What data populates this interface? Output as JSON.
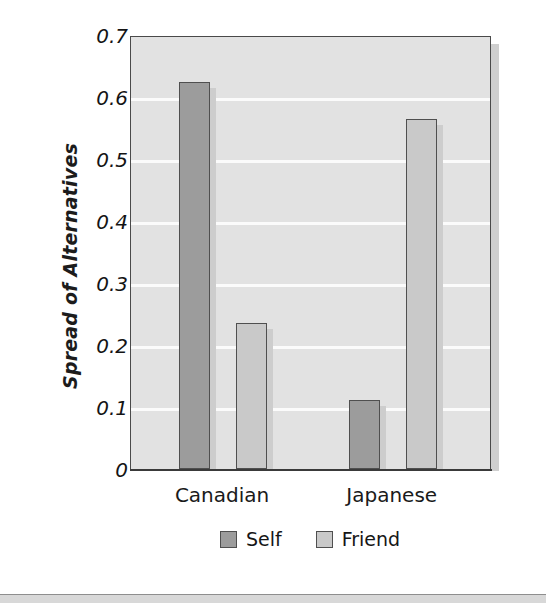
{
  "chart_data": {
    "type": "bar",
    "title": "",
    "xlabel": "",
    "ylabel": "Spread of Alternatives",
    "categories": [
      "Canadian",
      "Japanese"
    ],
    "series": [
      {
        "name": "Self",
        "values": [
          0.625,
          0.112
        ],
        "color": "#9c9c9c"
      },
      {
        "name": "Friend",
        "values": [
          0.235,
          0.565
        ],
        "color": "#c9c9c9"
      }
    ],
    "ylim": [
      0,
      0.7
    ],
    "ytick_step": 0.1,
    "ytick_labels": [
      "0.7",
      "0.6",
      "0.5",
      "0.4",
      "0.3",
      "0.2",
      "0.1",
      "0"
    ],
    "ytick_values": [
      0.7,
      0.6,
      0.5,
      0.4,
      0.3,
      0.2,
      0.1,
      0
    ],
    "grid": true,
    "grid_color": "#fbfbfb",
    "grid_orientation": "horizontal",
    "legend_position": "bottom-center",
    "plot_background": "#e2e2e2",
    "bar_outline_color": "#4f4f4f",
    "axis_color": "#3a3a3a",
    "grouped": true
  },
  "legend": {
    "items": [
      {
        "label": "Self",
        "color": "#9c9c9c"
      },
      {
        "label": "Friend",
        "color": "#c9c9c9"
      }
    ]
  },
  "axes": {
    "y_title": "Spread of Alternatives",
    "category_labels": [
      "Canadian",
      "Japanese"
    ]
  }
}
